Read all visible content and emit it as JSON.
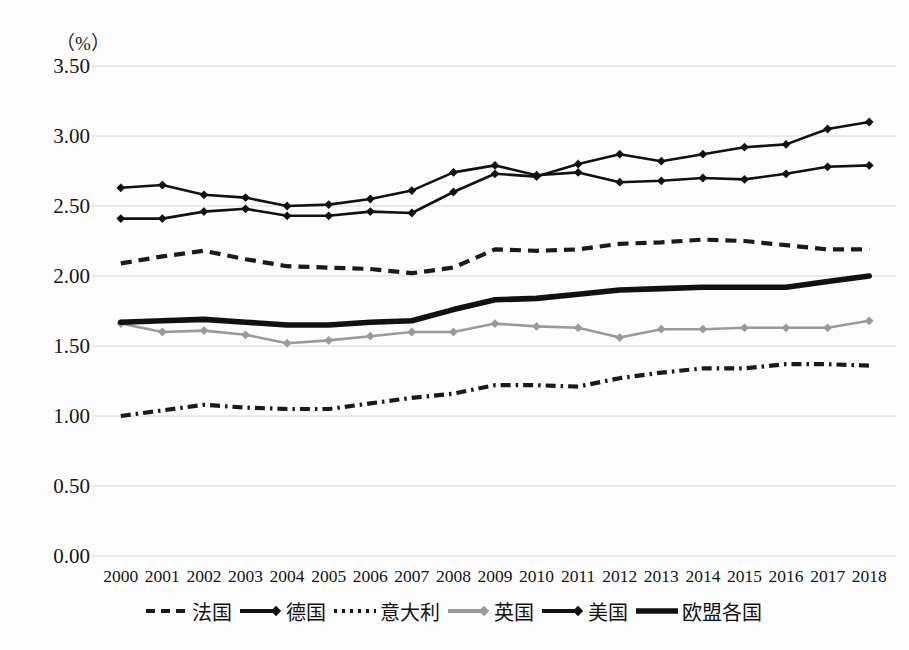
{
  "chart_data": {
    "type": "line",
    "title": "",
    "subtitle": "",
    "xlabel": "",
    "ylabel": "",
    "unit_label": "（%）",
    "grid": true,
    "legend_position": "bottom",
    "ylim": [
      0.0,
      3.5
    ],
    "ytick_labels": [
      "0.00",
      "0.50",
      "1.00",
      "1.50",
      "2.00",
      "2.50",
      "3.00",
      "3.50"
    ],
    "ytick_values": [
      0.0,
      0.5,
      1.0,
      1.5,
      2.0,
      2.5,
      3.0,
      3.5
    ],
    "categories": [
      "2000",
      "2001",
      "2002",
      "2003",
      "2004",
      "2005",
      "2006",
      "2007",
      "2008",
      "2009",
      "2010",
      "2011",
      "2012",
      "2013",
      "2014",
      "2015",
      "2016",
      "2017",
      "2018"
    ],
    "series": [
      {
        "name": "法国",
        "style": "dashed",
        "color": "#1a1a1a",
        "marker": "none",
        "values": [
          2.09,
          2.14,
          2.18,
          2.12,
          2.07,
          2.06,
          2.05,
          2.02,
          2.06,
          2.19,
          2.18,
          2.19,
          2.23,
          2.24,
          2.26,
          2.25,
          2.22,
          2.19,
          2.19
        ]
      },
      {
        "name": "德国",
        "style": "solid",
        "color": "#111111",
        "marker": "diamond",
        "values": [
          2.41,
          2.41,
          2.46,
          2.48,
          2.43,
          2.43,
          2.46,
          2.45,
          2.6,
          2.73,
          2.71,
          2.8,
          2.87,
          2.82,
          2.87,
          2.92,
          2.94,
          3.05,
          3.1
        ]
      },
      {
        "name": "意大利",
        "style": "dashdot",
        "color": "#1a1a1a",
        "marker": "none",
        "values": [
          1.0,
          1.04,
          1.08,
          1.06,
          1.05,
          1.05,
          1.09,
          1.13,
          1.16,
          1.22,
          1.22,
          1.21,
          1.27,
          1.31,
          1.34,
          1.34,
          1.37,
          1.37,
          1.36
        ]
      },
      {
        "name": "英国",
        "style": "solid",
        "color": "#9a9a9a",
        "marker": "diamond",
        "values": [
          1.66,
          1.6,
          1.61,
          1.58,
          1.52,
          1.54,
          1.57,
          1.6,
          1.6,
          1.66,
          1.64,
          1.63,
          1.56,
          1.62,
          1.62,
          1.63,
          1.63,
          1.63,
          1.68
        ]
      },
      {
        "name": "美国",
        "style": "solid",
        "color": "#111111",
        "marker": "diamond",
        "values": [
          2.63,
          2.65,
          2.58,
          2.56,
          2.5,
          2.51,
          2.55,
          2.61,
          2.74,
          2.79,
          2.72,
          2.74,
          2.67,
          2.68,
          2.7,
          2.69,
          2.73,
          2.78,
          2.79
        ]
      },
      {
        "name": "欧盟各国",
        "style": "solid-thick",
        "color": "#111111",
        "marker": "none",
        "values": [
          1.67,
          1.68,
          1.69,
          1.67,
          1.65,
          1.65,
          1.67,
          1.68,
          1.76,
          1.83,
          1.84,
          1.87,
          1.9,
          1.91,
          1.92,
          1.92,
          1.92,
          1.96,
          2.0
        ]
      }
    ]
  },
  "legend": {
    "items": [
      {
        "label": "法国",
        "swatch": "dashed-line-swatch"
      },
      {
        "label": "德国",
        "swatch": "solid-diamond-line-swatch"
      },
      {
        "label": "意大利",
        "swatch": "dotted-line-swatch"
      },
      {
        "label": "英国",
        "swatch": "gray-diamond-line-swatch"
      },
      {
        "label": "美国",
        "swatch": "solid-arrow-diamond-swatch"
      },
      {
        "label": "欧盟各国",
        "swatch": "thick-solid-line-swatch"
      }
    ]
  }
}
